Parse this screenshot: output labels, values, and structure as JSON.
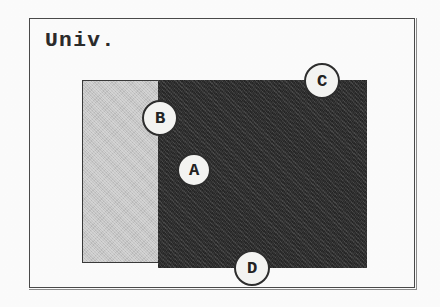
{
  "figure": {
    "title": "Univ.",
    "frame": {
      "border_color": "#4a4a4a"
    },
    "regions": [
      {
        "id": "light-region",
        "label": "",
        "fill_color": "#c4c4c4",
        "shade": "light-gray"
      },
      {
        "id": "dark-region",
        "label": "",
        "fill_color": "#343434",
        "shade": "dark-gray"
      }
    ],
    "callouts": [
      {
        "label": "A",
        "x": 194,
        "y": 170,
        "diameter": 34,
        "placement": "inside-dark-region"
      },
      {
        "label": "B",
        "x": 160,
        "y": 118,
        "diameter": 36,
        "placement": "on-light-dark-boundary"
      },
      {
        "label": "C",
        "x": 322,
        "y": 81,
        "diameter": 36,
        "placement": "on-dark-region-top-edge"
      },
      {
        "label": "D",
        "x": 252,
        "y": 268,
        "diameter": 36,
        "placement": "on-dark-region-bottom-edge"
      }
    ]
  }
}
